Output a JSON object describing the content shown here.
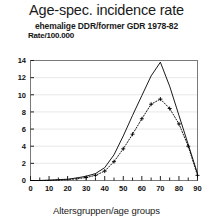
{
  "chart_data": {
    "type": "line",
    "title": "Age-spec. incidence rate",
    "subtitle": "ehemalige DDR/former GDR 1978-82",
    "ylabel": "Rate/100.000",
    "xlabel": "Altersgruppen/age groups",
    "xlim": [
      0,
      90
    ],
    "ylim": [
      0,
      14
    ],
    "xticks": [
      0,
      10,
      20,
      30,
      40,
      50,
      60,
      70,
      80,
      90
    ],
    "xticklabels": [
      "0",
      "10",
      "20",
      "30",
      "40",
      "50",
      "60",
      "70",
      "80",
      "90"
    ],
    "yticks": [
      0,
      2,
      4,
      6,
      8,
      10,
      12,
      14
    ],
    "yticklabels": [
      "0",
      "2",
      "4",
      "6",
      "8",
      "10",
      "12",
      "14"
    ],
    "xtick_minor_step": 5,
    "grid": true,
    "legend": null,
    "x": [
      0,
      5,
      10,
      15,
      20,
      25,
      30,
      35,
      40,
      45,
      50,
      55,
      60,
      65,
      70,
      75,
      80,
      85,
      90
    ],
    "series": [
      {
        "name": "solid-curve",
        "style": "solid",
        "marker": "none",
        "color": "#000000",
        "values": [
          0.0,
          0.0,
          0.05,
          0.1,
          0.15,
          0.3,
          0.5,
          0.8,
          1.5,
          3.0,
          5.2,
          7.6,
          9.9,
          12.2,
          13.8,
          11.0,
          7.6,
          4.2,
          0.8
        ]
      },
      {
        "name": "dotted-curve",
        "style": "dotted",
        "marker": "plus",
        "color": "#000000",
        "values": [
          0.0,
          0.0,
          0.0,
          0.05,
          0.1,
          0.2,
          0.35,
          0.6,
          1.1,
          2.2,
          3.7,
          5.4,
          7.2,
          8.9,
          9.5,
          8.4,
          6.6,
          4.0,
          0.6
        ]
      }
    ]
  }
}
